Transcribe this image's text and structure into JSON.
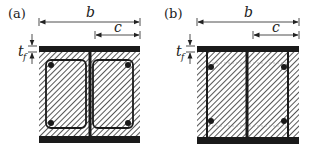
{
  "panels": [
    {
      "id": "a",
      "label": "(a)",
      "dim_b": "b",
      "dim_c": "c",
      "dim_tf": "t",
      "dim_tf_sub": "f",
      "description": "Encased I-section with closed stirrups and four corner longitudinal bars"
    },
    {
      "id": "b",
      "label": "(b)",
      "dim_b": "b",
      "dim_c": "c",
      "dim_tf": "t",
      "dim_tf_sub": "f",
      "description": "Partially encased I-section with straight bars welded to flanges and four longitudinal bars"
    }
  ],
  "colors": {
    "steel": "#1a1a1a",
    "hatch": "#2a2a2a",
    "background": "#ffffff"
  }
}
